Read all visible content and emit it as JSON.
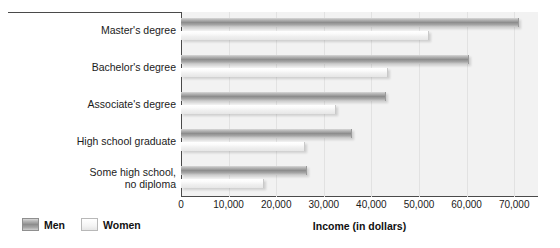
{
  "chart_data": {
    "type": "bar",
    "orientation": "horizontal",
    "title": "",
    "xlabel": "Income (in dollars)",
    "ylabel": "",
    "xlim": [
      0,
      75000
    ],
    "xticks": [
      "0",
      "10,000",
      "20,000",
      "30,000",
      "40,000",
      "50,000",
      "60,000",
      "70,000"
    ],
    "xtick_values": [
      0,
      10000,
      20000,
      30000,
      40000,
      50000,
      60000,
      70000
    ],
    "grid": true,
    "legend_position": "bottom-left",
    "categories": [
      "Master's degree",
      "Bachelor's degree",
      "Associate's degree",
      "High school graduate",
      "Some high school,\nno diploma"
    ],
    "series": [
      {
        "name": "Men",
        "color": "#8d8d8d",
        "values": [
          71000,
          60500,
          43000,
          36000,
          26500
        ]
      },
      {
        "name": "Women",
        "color": "#f0f0f0",
        "values": [
          52000,
          43500,
          32500,
          26000,
          17500
        ]
      }
    ]
  },
  "legend": {
    "men_label": "Men",
    "women_label": "Women"
  }
}
